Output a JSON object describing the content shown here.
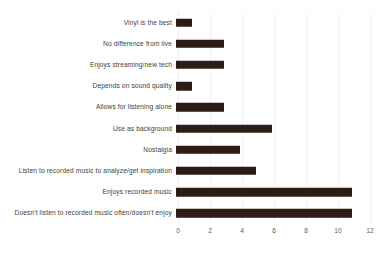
{
  "chart_data": {
    "type": "bar",
    "orientation": "horizontal",
    "title": "",
    "subtitle": "",
    "xlabel": "",
    "ylabel": "",
    "xlim": [
      0,
      12
    ],
    "xticks": [
      0,
      2,
      4,
      6,
      8,
      10,
      12
    ],
    "xtick_labels": [
      "0",
      "2",
      "4",
      "6",
      "8",
      "10",
      "12"
    ],
    "grid": true,
    "grid_axis": "x",
    "legend": false,
    "legend_position": "none",
    "bar_color": "#2b1d16",
    "label_color": "#3d3d3d",
    "tick_color": "#555555",
    "gridline_color": "#f1f1f1",
    "background_color": "#ffffff",
    "categories": [
      "Vinyl is the best",
      "No difference from live",
      "Enjoys streaming/new tech",
      "Depends on sound quality",
      "Allows for listening alone",
      "Use as background",
      "Nostalgia",
      "Listen to recorded music to analyze/get inspiration",
      "Enjoys recorded music",
      "Doesn't listen to recorded music often/doesn't enjoy"
    ],
    "values": [
      1,
      3,
      3,
      1,
      3,
      6,
      4,
      5,
      11,
      11
    ]
  }
}
